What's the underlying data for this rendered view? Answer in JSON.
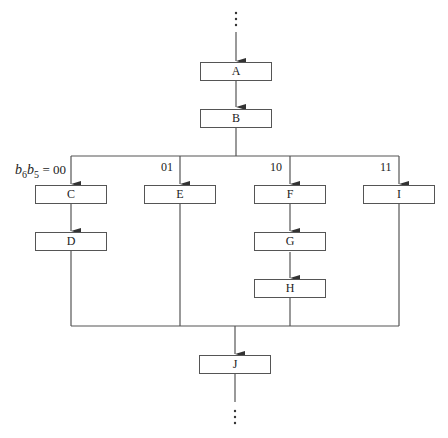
{
  "diagram": {
    "type": "flowchart",
    "nodes": {
      "A": "A",
      "B": "B",
      "C": "C",
      "D": "D",
      "E": "E",
      "F": "F",
      "G": "G",
      "H": "H",
      "I": "I",
      "J": "J"
    },
    "branch_labels": {
      "c": "= 00",
      "e": "01",
      "f": "10",
      "i": "11"
    },
    "condition_var": {
      "b1": "b",
      "s1": "6",
      "b2": "b",
      "s2": "5"
    },
    "edges": [
      [
        "...",
        "A"
      ],
      [
        "A",
        "B"
      ],
      [
        "B",
        "C"
      ],
      [
        "B",
        "E"
      ],
      [
        "B",
        "F"
      ],
      [
        "B",
        "I"
      ],
      [
        "C",
        "D"
      ],
      [
        "F",
        "G"
      ],
      [
        "G",
        "H"
      ],
      [
        "D",
        "J"
      ],
      [
        "E",
        "J"
      ],
      [
        "H",
        "J"
      ],
      [
        "I",
        "J"
      ],
      [
        "J",
        "..."
      ]
    ],
    "line_color": "#555555"
  }
}
